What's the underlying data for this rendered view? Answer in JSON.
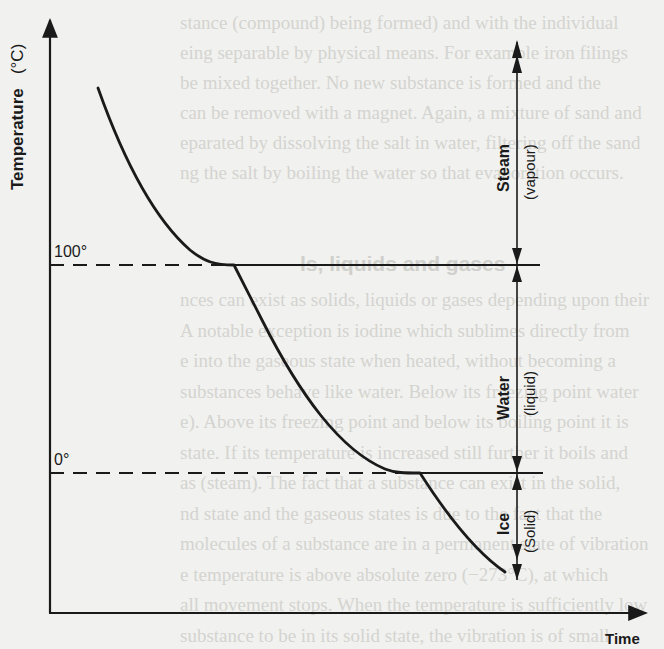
{
  "diagram": {
    "y_axis": {
      "label": "Temperature",
      "unit": "(°C)",
      "ticks": [
        {
          "label": "100°",
          "value": 100
        },
        {
          "label": "0°",
          "value": 0
        }
      ]
    },
    "x_axis": {
      "label": "Time"
    },
    "phases": [
      {
        "name": "Steam",
        "state": "(vapour)",
        "range": "above 100°"
      },
      {
        "name": "Water",
        "state": "(liquid)",
        "range": "0° to 100°"
      },
      {
        "name": "Ice",
        "state": "(Solid)",
        "range": "below 0°"
      }
    ],
    "curve": {
      "description": "Temperature falls steeply, plateaus at 100° (condensation), falls again, plateaus at 0° (freezing), then falls further.",
      "segments": [
        {
          "from": "start (high temperature)",
          "to": "100°",
          "kind": "cooling"
        },
        {
          "at": "100°",
          "kind": "plateau"
        },
        {
          "from": "100°",
          "to": "0°",
          "kind": "cooling"
        },
        {
          "at": "0°",
          "kind": "plateau"
        },
        {
          "from": "0°",
          "to": "below 0°",
          "kind": "cooling"
        }
      ]
    },
    "colors": {
      "ink": "#1a1a1a",
      "paper": "#f1f1ef",
      "bleed_text": "#d4d4d0"
    }
  },
  "background_text": {
    "heading": "ls, liquids and gases",
    "upper_lines": [
      "stance (compound) being formed) and with the individual",
      "eing separable by physical means. For example iron filings",
      "be mixed together. No new substance is formed and the",
      "can be removed with a magnet. Again, a mixture of sand and",
      "eparated by dissolving the salt in water, filtering off the sand",
      "ng the salt by boiling the water so that evaporation occurs."
    ],
    "lower_lines": [
      "nces can exist as solids, liquids or gases depending upon their",
      "A notable exception is iodine which sublimes directly from",
      "e into the gaseous state when heated, without becoming a",
      "substances behave like water. Below its freezing point water",
      "e). Above its freezing point and below its boiling point it is",
      "state. If its temperature is increased still further it boils and",
      "as (steam). The fact that a substance can exist in the solid,",
      "nd state and the gaseous states is due to the fact that the",
      "molecules of a substance are in a permanent state of vibration",
      "e temperature is above absolute zero (−273°C), at which",
      "all movement stops. When the temperature is sufficiently low",
      "substance to be in its solid state, the vibration is of small"
    ]
  }
}
